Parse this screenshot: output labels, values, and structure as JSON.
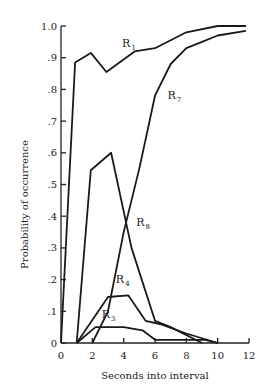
{
  "chart_data": {
    "type": "line",
    "title": "",
    "xlabel": "Seconds into interval",
    "ylabel": "Probability of occurrence",
    "xlim": [
      0,
      12
    ],
    "ylim": [
      0,
      1.0
    ],
    "x_ticks": [
      0,
      2,
      4,
      6,
      8,
      10,
      12
    ],
    "x_tick_labels": [
      "0",
      "2",
      "4",
      "6",
      "8",
      "10",
      "12"
    ],
    "y_ticks": [
      0,
      0.1,
      0.2,
      0.3,
      0.4,
      0.5,
      0.6,
      0.7,
      0.8,
      0.9,
      1.0
    ],
    "y_tick_labels": [
      "0",
      ".1",
      ".2",
      ".3",
      ".4",
      ".5",
      ".6",
      ".7",
      ".8",
      ".9",
      "1.0"
    ],
    "grid": false,
    "legend": "inline labels",
    "series": [
      {
        "name": "R1",
        "base": "R",
        "sub": "1",
        "label_at": [
          3.9,
          0.935
        ],
        "x": [
          0,
          0.9,
          1.9,
          2.9,
          4.7,
          6,
          8,
          10,
          11.8
        ],
        "y": [
          0,
          0.885,
          0.915,
          0.855,
          0.92,
          0.93,
          0.98,
          1.0,
          1.0
        ]
      },
      {
        "name": "R7",
        "base": "R",
        "sub": "7",
        "label_at": [
          6.8,
          0.77
        ],
        "x": [
          2,
          3,
          4,
          5,
          6,
          7,
          8,
          9,
          10,
          11.8
        ],
        "y": [
          0,
          0.1,
          0.35,
          0.55,
          0.78,
          0.88,
          0.93,
          0.95,
          0.97,
          0.985
        ]
      },
      {
        "name": "R8",
        "base": "R",
        "sub": "8",
        "label_at": [
          4.8,
          0.37
        ],
        "x": [
          1,
          1.9,
          3.2,
          4.5,
          6,
          7,
          9
        ],
        "y": [
          0,
          0.545,
          0.6,
          0.3,
          0.07,
          0.05,
          0
        ]
      },
      {
        "name": "R4",
        "base": "R",
        "sub": "4",
        "label_at": [
          3.5,
          0.19
        ],
        "x": [
          1,
          3,
          4.3,
          5.4,
          6.3,
          8,
          10
        ],
        "y": [
          0,
          0.145,
          0.15,
          0.07,
          0.06,
          0.03,
          0
        ]
      },
      {
        "name": "R3",
        "base": "R",
        "sub": "3",
        "label_at": [
          2.6,
          0.08
        ],
        "x": [
          1,
          2.2,
          4,
          5.2,
          6,
          9.2,
          10
        ],
        "y": [
          0,
          0.05,
          0.05,
          0.04,
          0.01,
          0.01,
          0
        ]
      }
    ]
  }
}
